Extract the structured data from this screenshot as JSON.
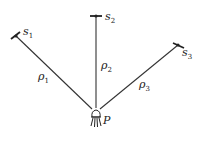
{
  "diagram": {
    "satellites": [
      {
        "name": "s",
        "sub": "1"
      },
      {
        "name": "s",
        "sub": "2"
      },
      {
        "name": "s",
        "sub": "3"
      }
    ],
    "ranges": [
      {
        "name": "ρ",
        "sub": "1"
      },
      {
        "name": "ρ",
        "sub": "2"
      },
      {
        "name": "ρ",
        "sub": "3"
      }
    ],
    "receiver": {
      "label": "P"
    },
    "colors": {
      "line": "#333333",
      "text": "#222222"
    }
  }
}
